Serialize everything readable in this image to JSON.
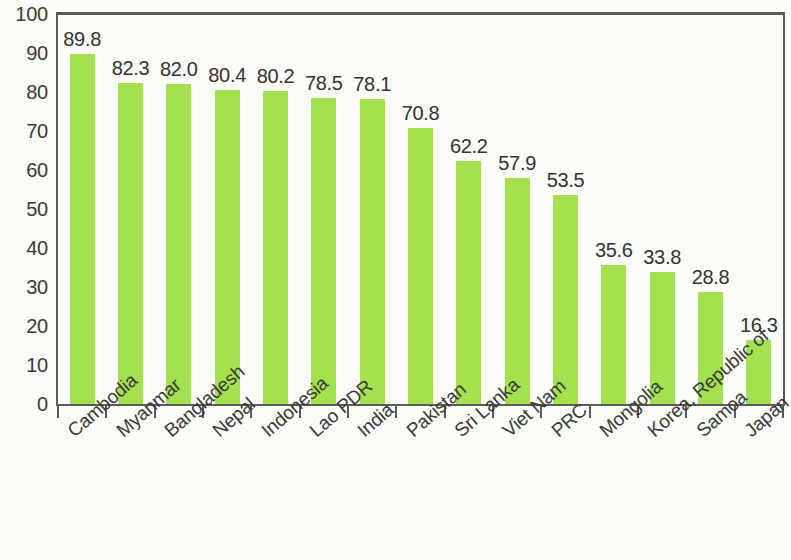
{
  "chart_data": {
    "type": "bar",
    "title": "",
    "subtitle": "",
    "xlabel": "",
    "ylabel": "",
    "ylim": [
      0,
      100
    ],
    "grid": false,
    "legend": null,
    "bar_color": "#a5e04f",
    "axis_color": "#5b5b5b",
    "text_color": "#3a3a3a",
    "background_color": "#fbfbf8",
    "y_ticks": [
      "0",
      "10",
      "20",
      "30",
      "40",
      "50",
      "60",
      "70",
      "80",
      "90",
      "100"
    ],
    "y_tick_values": [
      0,
      10,
      20,
      30,
      40,
      50,
      60,
      70,
      80,
      90,
      100
    ],
    "categories": [
      "Cambodia",
      "Myanmar",
      "Bangladesh",
      "Nepal",
      "Indonesia",
      "Lao PDR",
      "India",
      "Pakistan",
      "Sri Lanka",
      "Viet Nam",
      "PRC",
      "Mongolia",
      "Korea, Republic of",
      "Samoa",
      "Japan"
    ],
    "values": [
      89.8,
      82.3,
      82.0,
      80.4,
      80.2,
      78.5,
      78.1,
      70.8,
      62.2,
      57.9,
      53.5,
      35.6,
      33.8,
      28.8,
      16.3
    ],
    "value_labels": [
      "89.8",
      "82.3",
      "82.0",
      "80.4",
      "80.2",
      "78.5",
      "78.1",
      "70.8",
      "62.2",
      "57.9",
      "53.5",
      "35.6",
      "33.8",
      "28.8",
      "16.3"
    ]
  }
}
